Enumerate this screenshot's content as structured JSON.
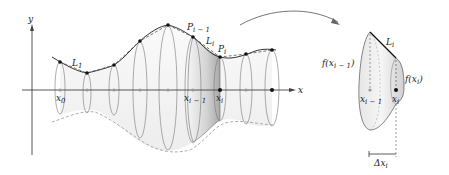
{
  "diagram": {
    "axes": {
      "x_label": "x",
      "y_label": "y"
    },
    "left_figure": {
      "segment_label_first": "L",
      "segment_label_first_sub": "1",
      "point_prev_label": "P",
      "point_prev_sub": "i − 1",
      "segment_label": "L",
      "segment_sub": "i",
      "point_label": "P",
      "point_sub": "i",
      "x0_label": "x",
      "x0_sub": "0",
      "xim1_label": "x",
      "xim1_sub": "i − 1",
      "xi_label": "x",
      "xi_sub": "i"
    },
    "right_figure": {
      "segment_label": "L",
      "segment_sub": "i",
      "f_prev_label": "f(x",
      "f_prev_sub": "i − 1",
      "f_prev_close": ")",
      "f_label": "f(x",
      "f_sub": "i",
      "f_close": ")",
      "xim1_label": "x",
      "xim1_sub": "i − 1",
      "xi_label": "x",
      "xi_sub": "i",
      "dx_label": "Δx",
      "dx_sub": "i"
    },
    "colors": {
      "stroke": "#333333",
      "surface": "#eeeeee",
      "shaded_frustum": "#bdbdbd",
      "axis": "#444444"
    }
  }
}
